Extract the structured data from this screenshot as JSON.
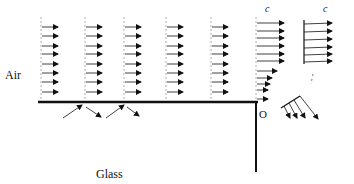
{
  "labels": {
    "air": "Air",
    "glass": "Glass",
    "origin": "O",
    "c_left": "c",
    "c_right": "c"
  },
  "colors": {
    "line": "#111111",
    "dashed": "#999999",
    "background": "#ffffff"
  },
  "diagram": {
    "uniform_columns_x": [
      41,
      85,
      124,
      166,
      211
    ],
    "arrow_rows_y": [
      27,
      36,
      46,
      54,
      64,
      73,
      82,
      92
    ],
    "corner_column": {
      "x": 256,
      "upper_arrow_rows_y": [
        23,
        31,
        38,
        46,
        54,
        61
      ],
      "lower_arrows": [
        {
          "y": 71,
          "len": 20
        },
        {
          "y": 78,
          "len": 15
        },
        {
          "y": 84,
          "len": 13
        },
        {
          "y": 90,
          "len": 11
        },
        {
          "y": 99,
          "len": 11
        }
      ]
    },
    "right_profile": {
      "x": 304,
      "rows_y": [
        24,
        32,
        40,
        48,
        55,
        62
      ]
    },
    "surface_y": 102,
    "surface_x_range": [
      38,
      256
    ],
    "wall_x": 256,
    "wall_y_range": [
      102,
      172
    ]
  }
}
